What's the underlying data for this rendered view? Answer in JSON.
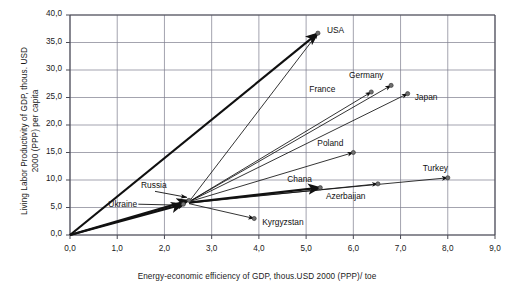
{
  "chart_data": {
    "type": "scatter",
    "title": "",
    "xlabel": "Energy-economic efficiency of GDP, thous.USD 2000 (PPP)/ toe",
    "ylabel": "Living Labor Productivity of GDP, thous. USD 2000 (PPP) per capita",
    "xlim": [
      0.0,
      9.0
    ],
    "ylim": [
      0.0,
      40.0
    ],
    "xticks": [
      "0,0",
      "1,0",
      "2,0",
      "3,0",
      "4,0",
      "5,0",
      "6,0",
      "7,0",
      "8,0",
      "9,0"
    ],
    "yticks": [
      "0,0",
      "5,0",
      "10,0",
      "15,0",
      "20,0",
      "25,0",
      "30,0",
      "35,0",
      "40,0"
    ],
    "xtick_values": [
      0,
      1,
      2,
      3,
      4,
      5,
      6,
      7,
      8,
      9
    ],
    "ytick_values": [
      0,
      5,
      10,
      15,
      20,
      25,
      30,
      35,
      40
    ],
    "grid": true,
    "legend": "none",
    "decimal_separator": "comma",
    "series": [
      {
        "name": "Country trajectory vectors",
        "points": [
          {
            "label": "USA",
            "x": 5.25,
            "y": 36.7,
            "label_dx": 9,
            "label_dy": -3
          },
          {
            "label": "Germany",
            "x": 6.8,
            "y": 27.2,
            "label_dx": -12,
            "label_dy": -10
          },
          {
            "label": "France",
            "x": 6.38,
            "y": 26.0,
            "label_dx": -40,
            "label_dy": -3
          },
          {
            "label": "Japan",
            "x": 7.15,
            "y": 25.7,
            "label_dx": 7,
            "label_dy": 3
          },
          {
            "label": "Poland",
            "x": 6.0,
            "y": 15.0,
            "label_dx": -14,
            "label_dy": -10
          },
          {
            "label": "Turkey",
            "x": 8.0,
            "y": 10.4,
            "label_dx": -4,
            "label_dy": -10
          },
          {
            "label": "Azerbaijan",
            "x": 6.52,
            "y": 9.3,
            "label_dx": -16,
            "label_dy": 12
          },
          {
            "label": "Chana",
            "x": 5.3,
            "y": 8.6,
            "label_dx": -12,
            "label_dy": -9
          },
          {
            "label": "Kyrgyzstan",
            "x": 3.9,
            "y": 3.0,
            "label_dx": 8,
            "label_dy": 3
          },
          {
            "label": "Russia",
            "x": 2.52,
            "y": 6.3,
            "label_dx": -26,
            "label_dy": -15
          },
          {
            "label": "Ukraine",
            "x": 2.4,
            "y": 5.6,
            "label_dx": -50,
            "label_dy": 0
          }
        ]
      }
    ],
    "vectors_from_origin": [
      {
        "to": "USA",
        "x0": 0.0,
        "y0": 0.0,
        "x1": 5.25,
        "y1": 36.7,
        "weight": "thick"
      },
      {
        "to": "Ukraine",
        "x0": 0.0,
        "y0": 0.0,
        "x1": 2.4,
        "y1": 5.6,
        "weight": "thick"
      },
      {
        "to": "Russia",
        "x0": 0.0,
        "y0": 0.0,
        "x1": 2.52,
        "y1": 6.3,
        "weight": "thick"
      },
      {
        "to": "USA-b",
        "x0": 0.0,
        "y0": 0.0,
        "x1": 5.25,
        "y1": 36.7,
        "weight": "thin"
      }
    ],
    "vectors_from_cluster": [
      {
        "to": "USA",
        "x0": 2.52,
        "y0": 6.05,
        "x1": 5.25,
        "y1": 36.7,
        "weight": "thin"
      },
      {
        "to": "Germany",
        "x0": 2.52,
        "y0": 6.05,
        "x1": 6.8,
        "y1": 27.2,
        "weight": "thin"
      },
      {
        "to": "France",
        "x0": 2.52,
        "y0": 6.05,
        "x1": 6.38,
        "y1": 26.0,
        "weight": "thin"
      },
      {
        "to": "Japan",
        "x0": 2.52,
        "y0": 6.05,
        "x1": 7.15,
        "y1": 25.7,
        "weight": "thin"
      },
      {
        "to": "Poland",
        "x0": 2.52,
        "y0": 6.05,
        "x1": 6.0,
        "y1": 15.0,
        "weight": "thin"
      },
      {
        "to": "Turkey",
        "x0": 2.52,
        "y0": 5.95,
        "x1": 8.0,
        "y1": 10.4,
        "weight": "thin"
      },
      {
        "to": "Azerbaijan",
        "x0": 2.52,
        "y0": 5.8,
        "x1": 6.52,
        "y1": 9.3,
        "weight": "thin"
      },
      {
        "to": "Chana",
        "x0": 2.52,
        "y0": 5.9,
        "x1": 5.3,
        "y1": 8.6,
        "weight": "thick"
      },
      {
        "to": "Kyrgyzstan",
        "x0": 2.52,
        "y0": 5.7,
        "x1": 3.9,
        "y1": 3.0,
        "weight": "thin"
      }
    ],
    "colors": {
      "line": "#111111",
      "grid": "#7d7d8c",
      "axis": "#4a4a55",
      "text": "#1a1a1a",
      "background": "#ffffff"
    }
  }
}
